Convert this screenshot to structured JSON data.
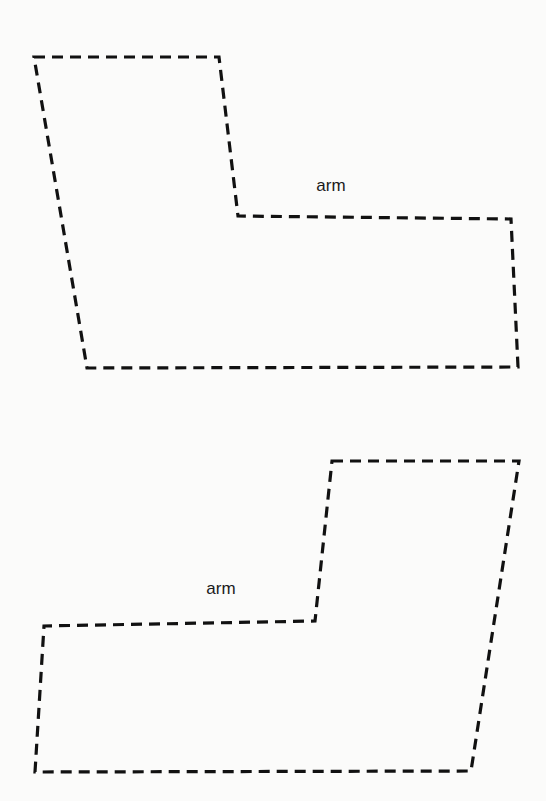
{
  "figure": {
    "background": "#fbfbfa",
    "stroke_color": "#111111",
    "line_style": "dashed",
    "shapes": [
      {
        "id": "top-shape",
        "description": "L-shaped dashed outline with arm extending to the right (lower portion)",
        "points": [
          [
            34,
            57
          ],
          [
            219,
            57
          ],
          [
            238,
            216
          ],
          [
            511,
            219
          ],
          [
            518,
            367
          ],
          [
            87,
            368
          ]
        ],
        "label": {
          "text": "arm",
          "x": 331,
          "y": 185
        }
      },
      {
        "id": "bottom-shape",
        "description": "L-shaped dashed outline with arm extending to the left (lower portion)",
        "points": [
          [
            332,
            461
          ],
          [
            519,
            461
          ],
          [
            471,
            771
          ],
          [
            35,
            772
          ],
          [
            44,
            626
          ],
          [
            315,
            621
          ]
        ],
        "label": {
          "text": "arm",
          "x": 221,
          "y": 588
        }
      }
    ]
  }
}
